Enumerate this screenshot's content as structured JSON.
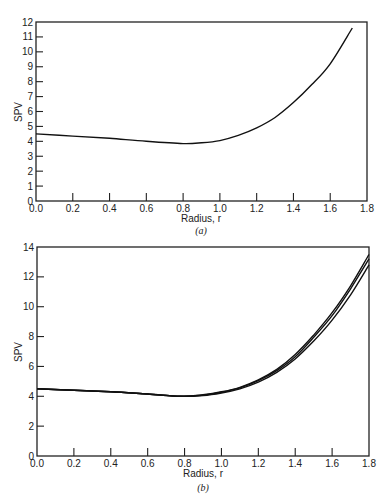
{
  "chart_data": [
    {
      "type": "line",
      "panel": "(a)",
      "title": "",
      "xlabel": "Radius, r",
      "ylabel": "SPV",
      "xlim": [
        0.0,
        1.8
      ],
      "ylim": [
        0,
        12
      ],
      "xticks": [
        "0.0",
        "0.2",
        "0.4",
        "0.6",
        "0.8",
        "1.0",
        "1.2",
        "1.4",
        "1.6",
        "1.8"
      ],
      "yticks": [
        "0",
        "1",
        "2",
        "3",
        "4",
        "5",
        "6",
        "7",
        "8",
        "9",
        "10",
        "11",
        "12"
      ],
      "grid": false,
      "series": [
        {
          "name": "SPV",
          "x": [
            0.0,
            0.2,
            0.4,
            0.6,
            0.8,
            0.9,
            1.0,
            1.1,
            1.2,
            1.3,
            1.4,
            1.5,
            1.6,
            1.72
          ],
          "y": [
            4.5,
            4.35,
            4.2,
            4.0,
            3.85,
            3.9,
            4.05,
            4.4,
            4.9,
            5.6,
            6.6,
            7.8,
            9.2,
            11.6
          ]
        }
      ]
    },
    {
      "type": "line",
      "panel": "(b)",
      "title": "",
      "xlabel": "Radius, r",
      "ylabel": "SPV",
      "xlim": [
        0.0,
        1.8
      ],
      "ylim": [
        0,
        14
      ],
      "xticks": [
        "0.0",
        "0.2",
        "0.4",
        "0.6",
        "0.8",
        "1.0",
        "1.2",
        "1.4",
        "1.6",
        "1.8"
      ],
      "yticks": [
        "0",
        "2",
        "4",
        "6",
        "8",
        "10",
        "12",
        "14"
      ],
      "grid": false,
      "series": [
        {
          "name": "curve 1",
          "x": [
            0.0,
            0.2,
            0.4,
            0.6,
            0.78,
            0.9,
            1.0,
            1.1,
            1.2,
            1.3,
            1.4,
            1.5,
            1.6,
            1.7,
            1.8
          ],
          "y": [
            4.5,
            4.4,
            4.3,
            4.15,
            4.0,
            4.1,
            4.3,
            4.6,
            5.1,
            5.8,
            6.8,
            8.1,
            9.6,
            11.4,
            13.5
          ]
        },
        {
          "name": "curve 2",
          "x": [
            0.0,
            0.2,
            0.4,
            0.6,
            0.78,
            0.9,
            1.0,
            1.1,
            1.2,
            1.3,
            1.4,
            1.5,
            1.6,
            1.7,
            1.8
          ],
          "y": [
            4.5,
            4.4,
            4.3,
            4.15,
            4.0,
            4.08,
            4.27,
            4.57,
            5.05,
            5.72,
            6.65,
            7.95,
            9.4,
            11.2,
            13.2
          ]
        },
        {
          "name": "curve 3",
          "x": [
            0.0,
            0.2,
            0.4,
            0.6,
            0.78,
            0.9,
            1.0,
            1.1,
            1.2,
            1.3,
            1.4,
            1.5,
            1.6,
            1.7,
            1.8
          ],
          "y": [
            4.5,
            4.4,
            4.3,
            4.15,
            4.0,
            4.05,
            4.22,
            4.5,
            4.95,
            5.6,
            6.5,
            7.7,
            9.1,
            10.8,
            12.8
          ]
        }
      ]
    }
  ],
  "panels": {
    "a": {
      "ylabel": "SPV",
      "xlabel": "Radius, r",
      "caption": "(a)"
    },
    "b": {
      "ylabel": "SPV",
      "xlabel": "Radius, r",
      "caption": "(b)"
    }
  }
}
